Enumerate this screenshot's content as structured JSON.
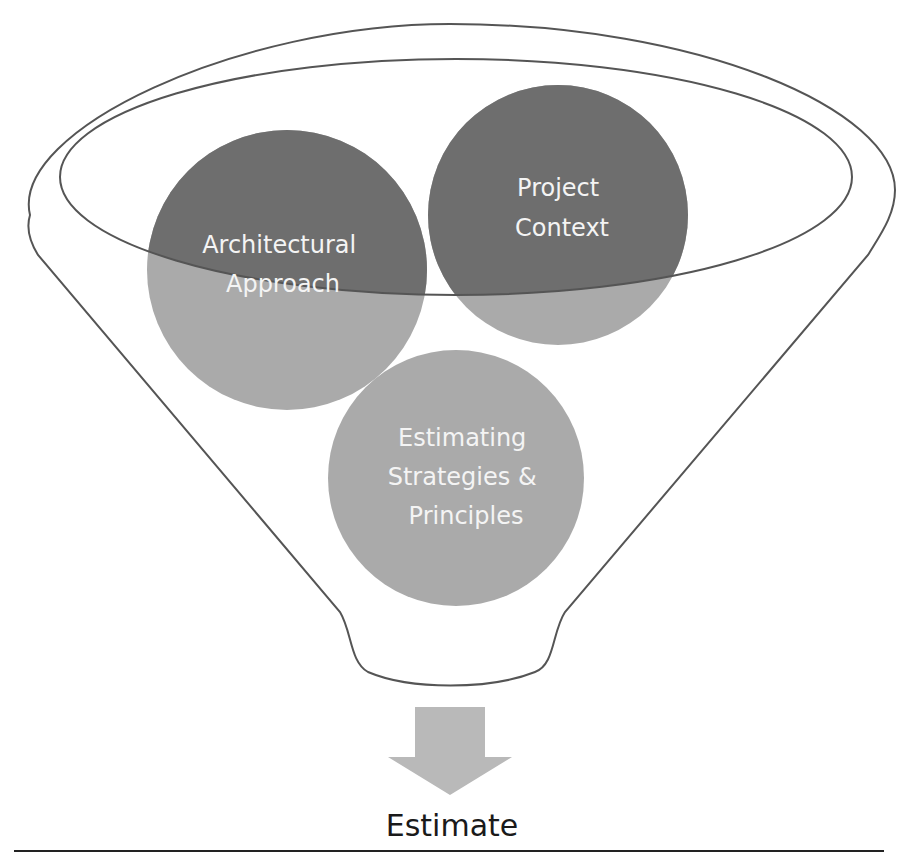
{
  "diagram": {
    "type": "funnel",
    "colors": {
      "dark_circle": "#6e6e6e",
      "light_circle": "#aaaaaa",
      "funnel_stroke": "#555555",
      "arrow": "#b9b9b9",
      "output_text": "#1a1a1a",
      "rule": "#222222"
    },
    "inputs": [
      {
        "id": "architectural-approach",
        "lines": [
          "Architectural",
          "Approach"
        ]
      },
      {
        "id": "project-context",
        "lines": [
          "Project",
          "Context"
        ]
      },
      {
        "id": "estimating-strategies",
        "lines": [
          "Estimating",
          "Strategies &",
          "Principles"
        ]
      }
    ],
    "output": {
      "label": "Estimate"
    }
  }
}
